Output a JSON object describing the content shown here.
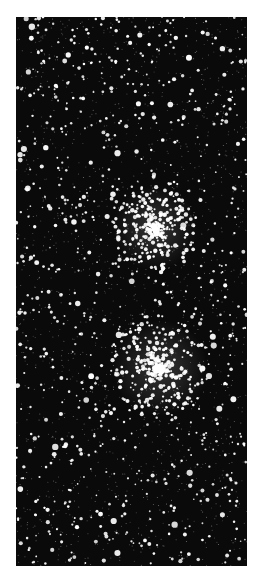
{
  "image": {
    "subject": "star field with two dense star clusters",
    "alt": "Black-and-white photograph of a dense star field with two bright star clusters",
    "frame": {
      "left": 16,
      "top": 17,
      "width": 231,
      "height": 549
    },
    "background_color": "#0a0a0a",
    "star_color": "#ffffff",
    "clusters": [
      {
        "cx": 139,
        "cy": 211,
        "radius": 42,
        "count": 260
      },
      {
        "cx": 144,
        "cy": 351,
        "radius": 48,
        "count": 320
      }
    ],
    "field_star_count": 900,
    "seed": 7
  }
}
